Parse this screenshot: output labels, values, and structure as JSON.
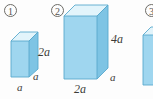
{
  "figure": {
    "background_color": "#fdfdfd",
    "width": 153,
    "height": 99
  },
  "colors": {
    "front_face": "#9fd6ef",
    "top_face": "#e2f4fb",
    "side_face": "#7ec4e4",
    "edge": "#5aa9cd",
    "text": "#3c3b38",
    "marker": "#55544f"
  },
  "items": [
    {
      "marker": "1",
      "marker_icon": "circled-number-icon",
      "shape": "rectangular-prism",
      "labels": {
        "height": "2a",
        "depth": "a",
        "width": "a"
      }
    },
    {
      "marker": "2",
      "marker_icon": "circled-number-icon",
      "shape": "rectangular-prism",
      "labels": {
        "height": "4a",
        "depth": "a",
        "width": "2a"
      }
    },
    {
      "marker": "3",
      "marker_icon": "circled-number-icon",
      "shape": "rectangular-prism-partial",
      "labels": {
        "height": "",
        "depth": "",
        "width": ""
      }
    }
  ]
}
